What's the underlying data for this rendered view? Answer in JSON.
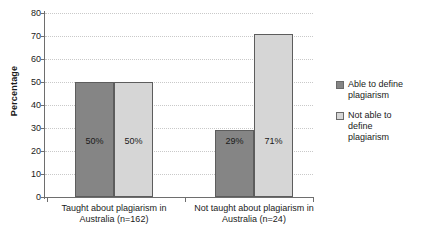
{
  "chart_data": {
    "type": "bar",
    "title": "",
    "xlabel": "",
    "ylabel": "Percentage",
    "ylim": [
      0,
      80
    ],
    "ytick_values": [
      0,
      10,
      20,
      30,
      40,
      50,
      60,
      70,
      80
    ],
    "ytick_labels": [
      "0",
      "10",
      "20",
      "30",
      "40",
      "50",
      "60",
      "70",
      "80"
    ],
    "grid": true,
    "grid_axis": "y",
    "legend_position": "right",
    "categories": [
      "Taught about plagiarism in Australia (n=162)",
      "Not taught about plagiarism in Australia (n=24)"
    ],
    "category_lines": [
      [
        "Taught about plagiarism in",
        "Australia (n=162)"
      ],
      [
        "Not taught about plagiarism in",
        "Australia (n=24)"
      ]
    ],
    "series": [
      {
        "name": "Able to define plagiarism",
        "name_lines": [
          "Able to define",
          "plagiarism"
        ],
        "color": "#858585",
        "values": [
          50,
          29
        ],
        "data_labels": [
          "50%",
          "29%"
        ]
      },
      {
        "name": "Not able to define plagiarism",
        "name_lines": [
          "Not able to",
          "define",
          "plagiarism"
        ],
        "color": "#d6d6d6",
        "values": [
          50,
          71
        ],
        "data_labels": [
          "50%",
          "71%"
        ]
      }
    ]
  },
  "axis": {
    "y_title": "Percentage"
  },
  "colors": {
    "series_dark": "#858585",
    "series_light": "#d6d6d6",
    "axis_line": "#6e6e6e",
    "gridline": "#c9c9c9",
    "background": "#ffffff"
  }
}
